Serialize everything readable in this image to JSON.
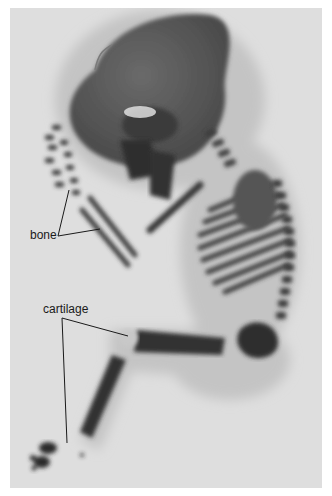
{
  "figure": {
    "labels": {
      "bone": "bone",
      "cartilage": "cartilage"
    },
    "colors": {
      "background": "#dedede",
      "stained_bone": "#3a3a3a",
      "soft_tissue": "#b8b8b8",
      "leader_line": "#1a1a1a"
    }
  }
}
